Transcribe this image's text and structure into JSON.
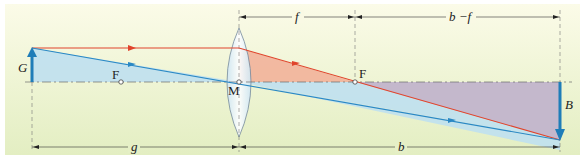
{
  "diagram": {
    "labels": {
      "object": "G",
      "image": "B",
      "center": "M",
      "focal_left": "F",
      "focal_right": "F",
      "focal_length": "f",
      "image_minus_f": "b −f",
      "object_distance": "g",
      "image_distance": "b"
    },
    "colors": {
      "background_top": "#f8f8e0",
      "background_bottom": "#e4efc4",
      "arrow_blue": "#1f7db8",
      "ray_red": "#e0442c",
      "ray_blue": "#2a88c4",
      "fill_blue": "#bfe0f0",
      "fill_red": "#f2b29a",
      "fill_purple": "#c4b8cc"
    }
  }
}
